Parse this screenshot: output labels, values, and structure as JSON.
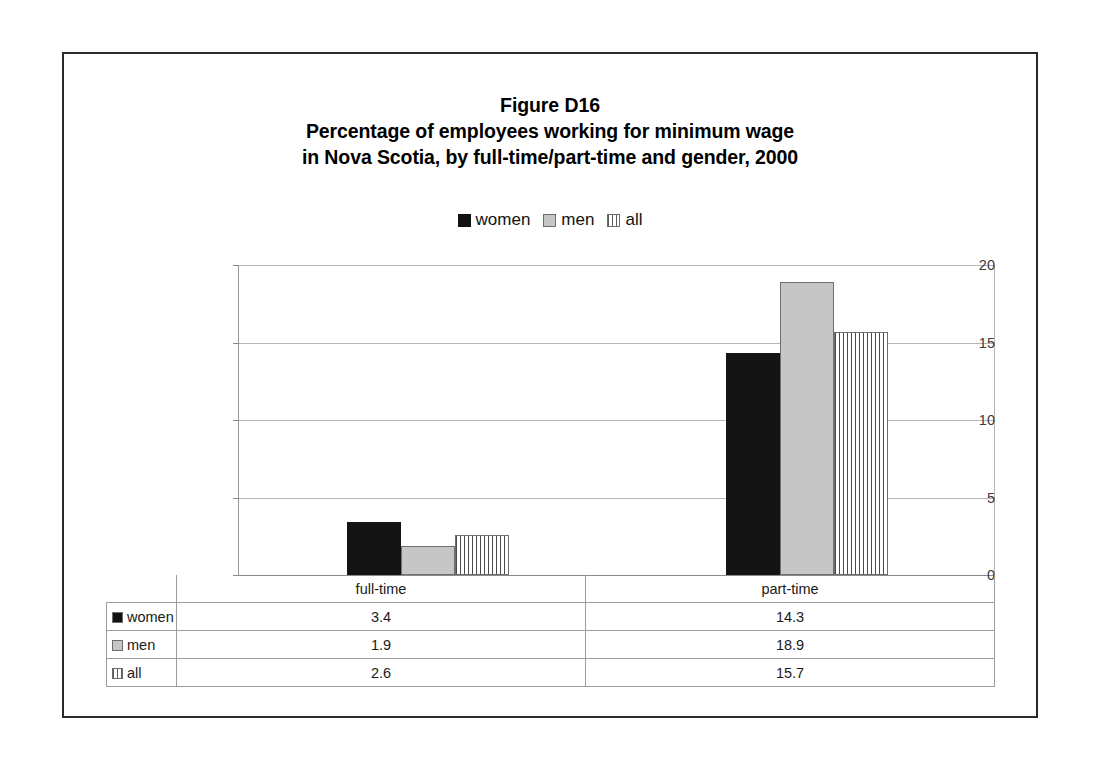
{
  "figure": {
    "title_lines": [
      "Figure D16",
      "Percentage of employees working for minimum wage",
      "in Nova Scotia, by full-time/part-time and gender, 2000"
    ]
  },
  "legend": {
    "items": [
      {
        "label": "women",
        "swatch": "solid-black-swatch-icon"
      },
      {
        "label": "men",
        "swatch": "solid-gray-swatch-icon"
      },
      {
        "label": "all",
        "swatch": "vertical-hatch-swatch-icon"
      }
    ]
  },
  "table": {
    "row_header_labels": [
      "women",
      "men",
      "all"
    ],
    "category_labels": [
      "full-time",
      "part-time"
    ],
    "rows": [
      {
        "label": "women",
        "values": [
          "3.4",
          "14.3"
        ]
      },
      {
        "label": "men",
        "values": [
          "1.9",
          "18.9"
        ]
      },
      {
        "label": "all",
        "values": [
          "2.6",
          "15.7"
        ]
      }
    ]
  },
  "colors": {
    "women": "#141414",
    "men": "#c6c6c6",
    "all": "#fbfbfb",
    "frame": "#2b2b2b",
    "gridline": "#b6b6b6"
  },
  "chart_data": {
    "type": "bar",
    "xlabel": "",
    "ylabel": "",
    "categories": [
      "full-time",
      "part-time"
    ],
    "series": [
      {
        "name": "women",
        "values": [
          3.4,
          14.3
        ]
      },
      {
        "name": "men",
        "values": [
          1.9,
          18.9
        ]
      },
      {
        "name": "all",
        "values": [
          2.6,
          15.7
        ]
      }
    ],
    "ylim": [
      0,
      20
    ],
    "yticks": [
      0,
      5,
      10,
      15,
      20
    ],
    "ytick_labels": [
      "0",
      "5",
      "10",
      "15",
      "20"
    ],
    "grid": true,
    "legend_position": "top-center"
  }
}
